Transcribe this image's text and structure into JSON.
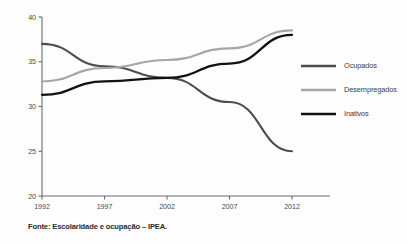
{
  "caption": "Fonte: Escolaridade e ocupação – IPEA.",
  "colors": {
    "ocupados": "#4d4d4d",
    "desempregados": "#a6a6a6",
    "inativos": "#111111",
    "axis": "#6b6b6b",
    "text": "#3c3c3c",
    "background": "#fdfdfd"
  },
  "chart_data": {
    "type": "line",
    "title": "",
    "xlabel": "",
    "ylabel": "",
    "x": [
      1992,
      1997,
      2002,
      2007,
      2012
    ],
    "categories": [
      "1992",
      "1997",
      "2002",
      "2007",
      "2012"
    ],
    "xtick_labels": [
      "1992",
      "1997",
      "2002",
      "2007",
      "2012"
    ],
    "ytick_labels": [
      "20",
      "25",
      "30",
      "35",
      "40"
    ],
    "yticks": [
      20,
      25,
      30,
      35,
      40
    ],
    "ylim": [
      20,
      40
    ],
    "xlim": [
      1992,
      2012
    ],
    "grid": false,
    "legend_position": "right",
    "series": [
      {
        "name": "Ocupados",
        "color": "#4d4d4d",
        "values": [
          37.0,
          34.5,
          33.2,
          30.5,
          25.0
        ]
      },
      {
        "name": "Desempregados",
        "color": "#a6a6a6",
        "values": [
          32.8,
          34.3,
          35.2,
          36.5,
          38.5
        ]
      },
      {
        "name": "Inativos",
        "color": "#111111",
        "values": [
          31.3,
          32.8,
          33.2,
          34.8,
          38.0
        ]
      }
    ]
  }
}
